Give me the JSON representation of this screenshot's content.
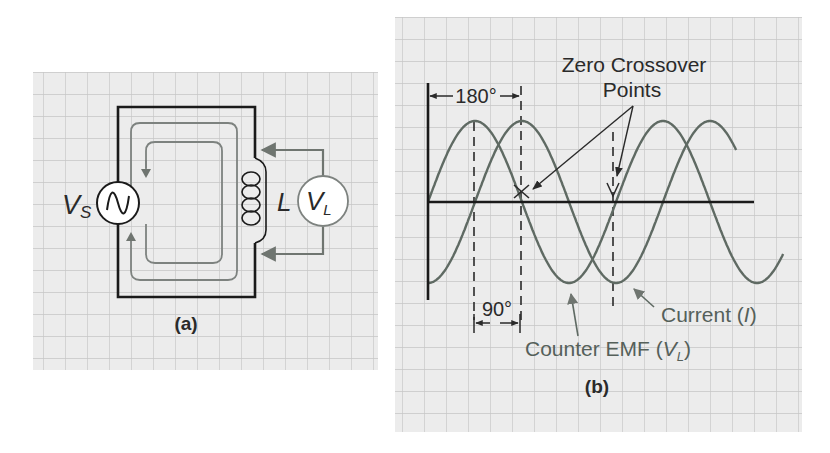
{
  "figure_a": {
    "caption": "(a)",
    "source_label_main": "V",
    "source_label_sub": "S",
    "inductor_label": "L",
    "meter_label_main": "V",
    "meter_label_sub": "L",
    "icons": {
      "source": "ac-voltage-source-icon",
      "inductor": "inductor-coil-icon",
      "meter": "voltmeter-icon"
    }
  },
  "figure_b": {
    "caption": "(b)",
    "annotation_line1": "Zero Crossover",
    "annotation_line2": "Points",
    "angle_180": "180°",
    "angle_90": "90°",
    "current_label_prefix": "Current (",
    "current_label_var": "I",
    "current_label_suffix": ")",
    "emf_label_prefix": "Counter EMF (",
    "emf_label_var": "V",
    "emf_label_sub": "L",
    "emf_label_suffix": ")"
  },
  "colors": {
    "grid_bg": "#ececec",
    "grid_line": "#c6c6c6",
    "wire": "#1a1a1a",
    "flux": "#7d827f",
    "curve": "#5f6a63",
    "text": "#2a2a2a"
  },
  "chart_data": {
    "type": "line",
    "xlabel": "Phase angle (degrees)",
    "ylabel": "Amplitude",
    "x": [
      0,
      45,
      90,
      135,
      180,
      225,
      270,
      315,
      360,
      405,
      450,
      495,
      540,
      585,
      630,
      675,
      720
    ],
    "series": [
      {
        "name": "Counter EMF (V_L)",
        "values": [
          0,
          0.71,
          1,
          0.71,
          0,
          -0.71,
          -1,
          -0.71,
          0,
          0.71,
          1,
          0.71,
          0,
          -0.71,
          -1,
          -0.71,
          0
        ],
        "x_end_deg": 680
      },
      {
        "name": "Current (I)",
        "values": [
          -1,
          -0.71,
          0,
          0.71,
          1,
          0.71,
          0,
          -0.71,
          -1,
          -0.71,
          0,
          0.71,
          1,
          0.71,
          0,
          -0.71,
          -1
        ],
        "x_end_deg": 590
      }
    ],
    "phase_shift_deg": 90,
    "annotations": [
      "Zero Crossover Points",
      "180°",
      "90°"
    ],
    "dashed_markers_deg": [
      90,
      180,
      360
    ],
    "grid": true,
    "ylim": [
      -1,
      1
    ]
  }
}
